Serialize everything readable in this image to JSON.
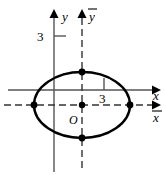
{
  "figure": {
    "background_color": "#ffffff",
    "stroke_color": "#000000",
    "axis_color": "#555555",
    "dashed_color": "#333333"
  },
  "axes": {
    "solid_y": {
      "label": "y",
      "x": 54,
      "top": 10,
      "bottom": 172
    },
    "solid_x": {
      "label": "x",
      "y": 90,
      "left": 8,
      "right": 160
    },
    "dashed_y": {
      "label": "y",
      "overline": true,
      "x": 82,
      "top": 10,
      "bottom": 172
    },
    "dashed_x": {
      "label": "x",
      "overline": true,
      "y": 105,
      "left": 4,
      "right": 160
    }
  },
  "ticks": [
    {
      "name": "y-axis-tick-3",
      "label": "3",
      "axis": "solid_y",
      "value": 3,
      "px_x": 54,
      "px_y": 36,
      "label_x": 44,
      "label_y": 41
    },
    {
      "name": "x-axis-tick-3",
      "label": "3",
      "axis": "solid_x",
      "value": 3,
      "px_x": 82,
      "px_y": 90,
      "label_x": 98,
      "label_y": 103
    }
  ],
  "ellipse": {
    "center": {
      "x": 82,
      "y": 105
    },
    "rx": 48,
    "ry": 33,
    "stroke_width": 2.4,
    "fill": "none"
  },
  "points": [
    {
      "name": "ellipse-center-point",
      "x": 82,
      "y": 105,
      "label": "O",
      "label_x": 72,
      "label_y": 121
    },
    {
      "name": "ellipse-vertex-right",
      "x": 130,
      "y": 105,
      "label": ""
    },
    {
      "name": "ellipse-vertex-left",
      "x": 34,
      "y": 105,
      "label": ""
    },
    {
      "name": "ellipse-vertex-top",
      "x": 82,
      "y": 72,
      "label": ""
    },
    {
      "name": "ellipse-vertex-bottom",
      "x": 82,
      "y": 138,
      "label": ""
    }
  ],
  "labels": {
    "origin": "O",
    "y_axis": "y",
    "x_axis": "x",
    "y_bar_axis": "y",
    "x_bar_axis": "x",
    "tick_y_3": "3",
    "tick_x_3": "3"
  }
}
